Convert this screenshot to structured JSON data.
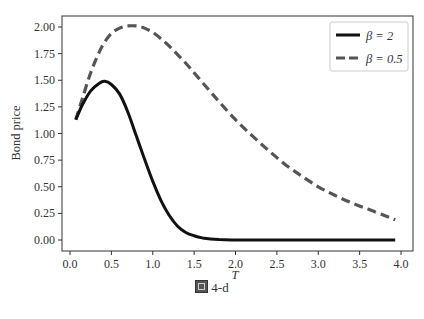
{
  "chart_data": {
    "type": "line",
    "title": "",
    "xlabel": "T",
    "ylabel": "Bond price",
    "xlim": [
      -0.12,
      4.12
    ],
    "ylim": [
      -0.1,
      2.1
    ],
    "xticks": [
      0.0,
      0.5,
      1.0,
      1.5,
      2.0,
      2.5,
      3.0,
      3.5,
      4.0
    ],
    "xtick_labels": [
      "0.0",
      "0.5",
      "1.0",
      "1.5",
      "2.0",
      "2.5",
      "3.0",
      "3.5",
      "4.0"
    ],
    "yticks": [
      0.0,
      0.25,
      0.5,
      0.75,
      1.0,
      1.25,
      1.5,
      1.75,
      2.0
    ],
    "ytick_labels": [
      "0.00",
      "0.25",
      "0.50",
      "0.75",
      "1.00",
      "1.25",
      "1.50",
      "1.75",
      "2.00"
    ],
    "grid": false,
    "legend_position": "upper right",
    "x": [
      0.07,
      0.15,
      0.25,
      0.35,
      0.42,
      0.5,
      0.6,
      0.7,
      0.8,
      0.85,
      0.9,
      1.0,
      1.1,
      1.2,
      1.3,
      1.4,
      1.5,
      1.6,
      1.7,
      1.8,
      2.0,
      2.2,
      2.4,
      2.6,
      2.8,
      3.0,
      3.2,
      3.4,
      3.6,
      3.8,
      3.93
    ],
    "series": [
      {
        "name": "β = 2",
        "style": "solid",
        "color": "#111111",
        "values": [
          1.13,
          1.27,
          1.4,
          1.47,
          1.49,
          1.46,
          1.37,
          1.2,
          0.98,
          0.87,
          0.76,
          0.55,
          0.37,
          0.23,
          0.13,
          0.07,
          0.04,
          0.02,
          0.01,
          0.005,
          0.0,
          0.0,
          0.0,
          0.0,
          0.0,
          0.0,
          0.0,
          0.0,
          0.0,
          0.0,
          0.0
        ]
      },
      {
        "name": "β = 0.5",
        "style": "dashed",
        "color": "#555555",
        "values": [
          1.13,
          1.33,
          1.57,
          1.76,
          1.86,
          1.94,
          1.99,
          2.01,
          2.01,
          2.0,
          1.99,
          1.95,
          1.89,
          1.82,
          1.74,
          1.66,
          1.57,
          1.48,
          1.39,
          1.3,
          1.13,
          0.98,
          0.84,
          0.71,
          0.6,
          0.5,
          0.42,
          0.35,
          0.29,
          0.23,
          0.19
        ]
      }
    ]
  },
  "legend": {
    "items": [
      {
        "label": "β = 2"
      },
      {
        "label": "β = 0.5"
      }
    ]
  },
  "axes": {
    "xlabel": "T",
    "ylabel": "Bond price"
  },
  "caption": {
    "label": "4-d"
  }
}
